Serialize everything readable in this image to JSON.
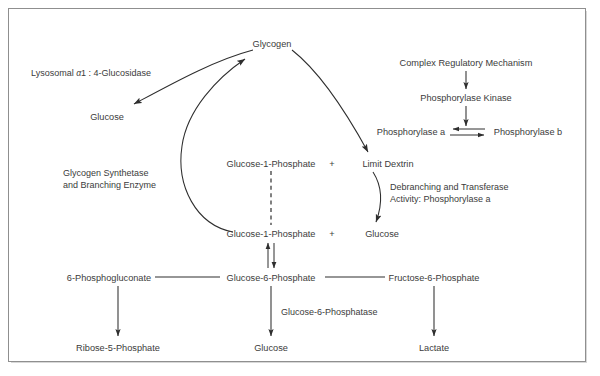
{
  "figure": {
    "type": "biochemical-pathway-diagram",
    "background_color": "#ffffff",
    "text_color": "#3b3b3b",
    "stroke_color": "#2e2e2e",
    "border_color": "#8f8f8f"
  },
  "nodes": {
    "glycogen": "Glycogen",
    "glucose_lysosomal": "Glucose",
    "glucose_1_phosphate_upper": "Glucose-1-Phosphate",
    "limit_dextrin": "Limit Dextrin",
    "glucose_1_phosphate_lower": "Glucose-1-Phosphate",
    "glucose_debranching": "Glucose",
    "complex_regulatory_mechanism": "Complex Regulatory Mechanism",
    "phosphorylase_kinase": "Phosphorylase Kinase",
    "phosphorylase_a": "Phosphorylase a",
    "phosphorylase_b": "Phosphorylase b",
    "six_phosphogluconate": "6-Phosphogluconate",
    "glucose_6_phosphate": "Glucose-6-Phosphate",
    "fructose_6_phosphate": "Fructose-6-Phosphate",
    "ribose_5_phosphate": "Ribose-5-Phosphate",
    "glucose_free": "Glucose",
    "lactate": "Lactate",
    "plus_upper": "+",
    "plus_lower": "+"
  },
  "enzyme_labels": {
    "lysosomal_glucosidase_prefix": "Lysosomal ",
    "lysosomal_glucosidase_alpha": "α",
    "lysosomal_glucosidase_suffix": "1 : 4-Glucosidase",
    "glycogen_synthetase_line1": "Glycogen Synthetase",
    "glycogen_synthetase_line2": "and Branching Enzyme",
    "debranching_line1": "Debranching and Transferase",
    "debranching_line2": "Activity: Phosphorylase a",
    "glucose_6_phosphatase": "Glucose-6-Phosphatase"
  },
  "edges": [
    {
      "name": "glycogen-to-glucose-lysosomal",
      "style": "curved-arrow",
      "from": "glycogen",
      "to": "glucose_lysosomal"
    },
    {
      "name": "glucose1phosphate-to-glycogen",
      "style": "curved-arrow",
      "from": "glucose_1_phosphate_lower",
      "to": "glycogen"
    },
    {
      "name": "glycogen-to-limit-dextrin",
      "style": "curved-arrow",
      "from": "glycogen",
      "to": "limit_dextrin"
    },
    {
      "name": "limit-dextrin-to-glucose",
      "style": "curved-arrow",
      "from": "limit_dextrin",
      "to": "glucose_debranching"
    },
    {
      "name": "regulatory-to-kinase",
      "style": "straight-arrow",
      "from": "complex_regulatory_mechanism",
      "to": "phosphorylase_kinase"
    },
    {
      "name": "kinase-to-phosphorylase-a",
      "style": "straight-arrow",
      "from": "phosphorylase_kinase",
      "to": "phosphorylase_a"
    },
    {
      "name": "phosphorylase-equilibrium",
      "style": "double-reversible-arrow",
      "from": "phosphorylase_b",
      "to": "phosphorylase_a"
    },
    {
      "name": "g1p-upper-to-g1p-lower",
      "style": "dashed-line",
      "from": "glucose_1_phosphate_upper",
      "to": "glucose_1_phosphate_lower"
    },
    {
      "name": "g1p-g6p-reversible",
      "style": "double-reversible-arrow-vertical",
      "from": "glucose_1_phosphate_lower",
      "to": "glucose_6_phosphate"
    },
    {
      "name": "g6p-to-6-phosphogluconate",
      "style": "plain-line",
      "from": "glucose_6_phosphate",
      "to": "six_phosphogluconate"
    },
    {
      "name": "g6p-to-fructose-6-phosphate",
      "style": "plain-line",
      "from": "glucose_6_phosphate",
      "to": "fructose_6_phosphate"
    },
    {
      "name": "6pg-to-ribose-5-phosphate",
      "style": "straight-arrow",
      "from": "six_phosphogluconate",
      "to": "ribose_5_phosphate"
    },
    {
      "name": "g6p-to-glucose",
      "style": "straight-arrow",
      "from": "glucose_6_phosphate",
      "to": "glucose_free"
    },
    {
      "name": "f6p-to-lactate",
      "style": "straight-arrow",
      "from": "fructose_6_phosphate",
      "to": "lactate"
    }
  ]
}
